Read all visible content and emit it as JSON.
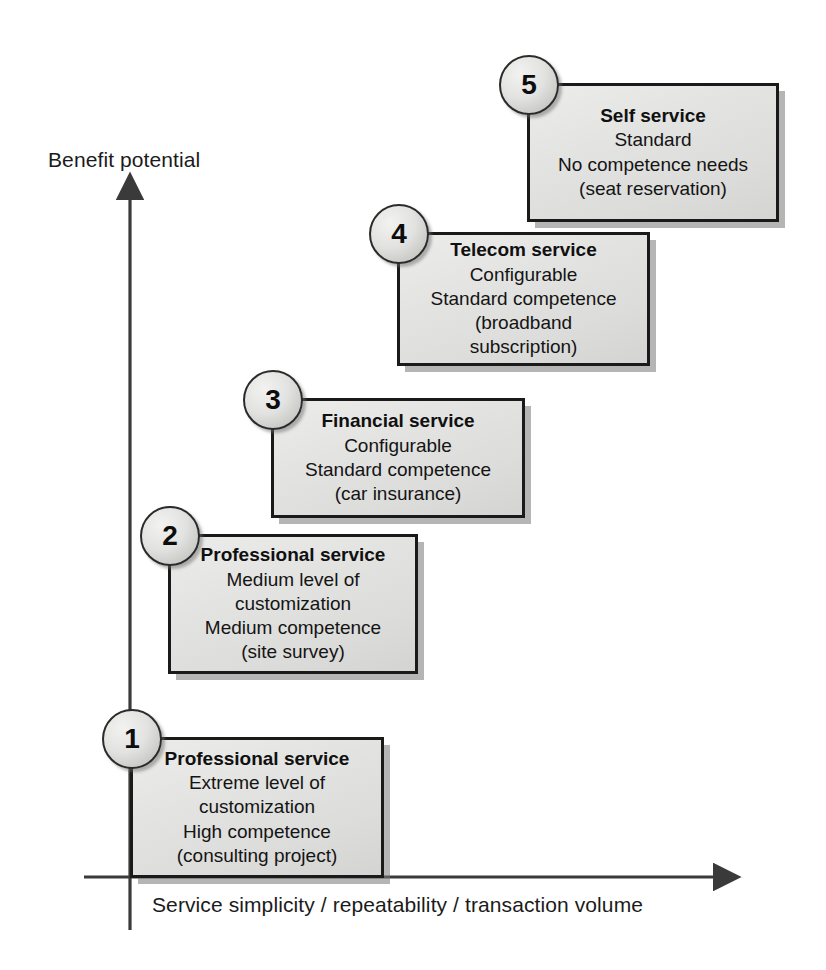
{
  "diagram": {
    "axes": {
      "y_label": "Benefit potential",
      "x_label": "Service simplicity / repeatability / transaction volume"
    },
    "colors": {
      "box_fill": "#e3e3e2",
      "box_border": "#1a1a1a",
      "badge_fill": "#e2e2e0",
      "shadow": "#787878",
      "text": "#141414"
    },
    "steps": [
      {
        "number": "1",
        "title": "Professional service",
        "lines": [
          "Extreme level of",
          "customization",
          "High competence",
          "(consulting project)"
        ]
      },
      {
        "number": "2",
        "title": "Professional service",
        "lines": [
          "Medium level of",
          "customization",
          "Medium competence",
          "(site survey)"
        ]
      },
      {
        "number": "3",
        "title": "Financial service",
        "lines": [
          "Configurable",
          "Standard competence",
          "(car insurance)"
        ]
      },
      {
        "number": "4",
        "title": "Telecom  service",
        "lines": [
          "Configurable",
          "Standard competence",
          "(broadband",
          "subscription)"
        ]
      },
      {
        "number": "5",
        "title": "Self  service",
        "lines": [
          "Standard",
          "No competence needs",
          "(seat reservation)"
        ]
      }
    ]
  }
}
